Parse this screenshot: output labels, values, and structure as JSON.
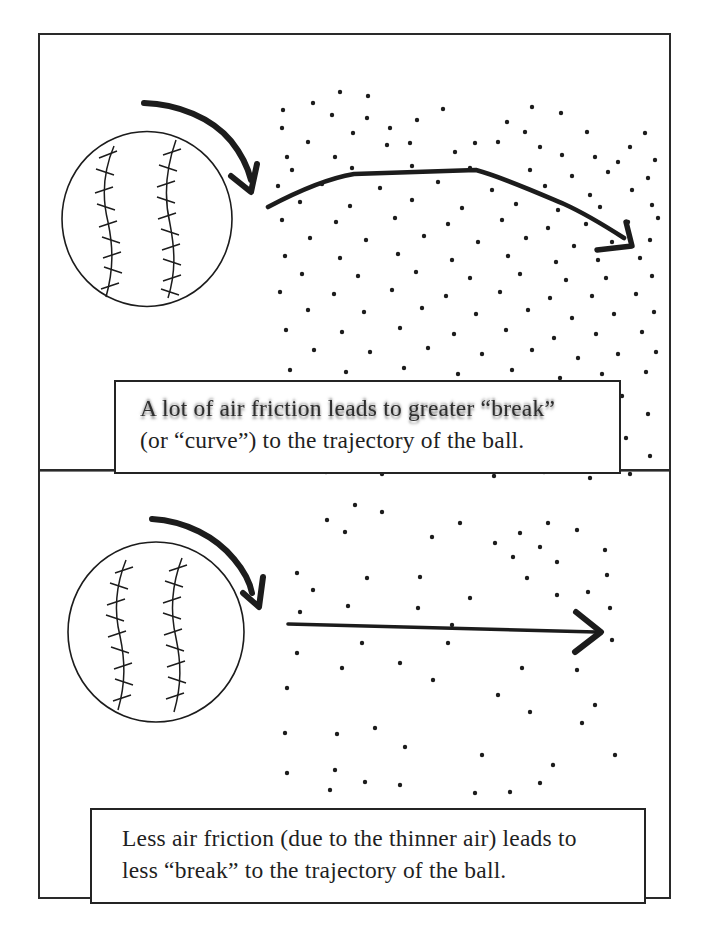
{
  "figure": {
    "type": "physics-diagram",
    "colors": {
      "ink": "#1c1c1c",
      "paper": "#ffffff",
      "frame": "#2a2a2a"
    },
    "panels": [
      {
        "id": "dense-air",
        "ball_icon": "baseball-icon",
        "spin_icon": "clockwise-spin-arrow-icon",
        "trajectory_icon": "breaking-trajectory-arrow-icon",
        "dots_icon": "air-molecule-dots",
        "caption": {
          "lines": [
            "A lot of air friction leads to greater “break”",
            "(or “curve”) to the trajectory of the ball."
          ]
        },
        "air_dots": [
          [
            340,
            92
          ],
          [
            368,
            96
          ],
          [
            283,
            110
          ],
          [
            313,
            103
          ],
          [
            443,
            109
          ],
          [
            532,
            107
          ],
          [
            561,
            113
          ],
          [
            282,
            128
          ],
          [
            332,
            115
          ],
          [
            390,
            128
          ],
          [
            417,
            120
          ],
          [
            507,
            122
          ],
          [
            525,
            132
          ],
          [
            587,
            132
          ],
          [
            645,
            133
          ],
          [
            287,
            157
          ],
          [
            308,
            142
          ],
          [
            353,
            133
          ],
          [
            387,
            145
          ],
          [
            410,
            143
          ],
          [
            455,
            152
          ],
          [
            475,
            143
          ],
          [
            498,
            142
          ],
          [
            540,
            147
          ],
          [
            562,
            155
          ],
          [
            595,
            157
          ],
          [
            618,
            162
          ],
          [
            335,
            157
          ],
          [
            367,
            118
          ],
          [
            630,
            147
          ],
          [
            655,
            160
          ],
          [
            292,
            170
          ],
          [
            352,
            168
          ],
          [
            412,
            166
          ],
          [
            470,
            168
          ],
          [
            530,
            170
          ],
          [
            572,
            176
          ],
          [
            608,
            172
          ],
          [
            648,
            178
          ],
          [
            278,
            186
          ],
          [
            322,
            184
          ],
          [
            380,
            188
          ],
          [
            438,
            182
          ],
          [
            492,
            190
          ],
          [
            545,
            186
          ],
          [
            590,
            195
          ],
          [
            632,
            190
          ],
          [
            300,
            202
          ],
          [
            350,
            206
          ],
          [
            412,
            200
          ],
          [
            462,
            208
          ],
          [
            516,
            204
          ],
          [
            558,
            210
          ],
          [
            600,
            207
          ],
          [
            652,
            205
          ],
          [
            282,
            220
          ],
          [
            336,
            222
          ],
          [
            395,
            218
          ],
          [
            448,
            224
          ],
          [
            502,
            220
          ],
          [
            548,
            228
          ],
          [
            586,
            224
          ],
          [
            628,
            222
          ],
          [
            658,
            218
          ],
          [
            310,
            238
          ],
          [
            366,
            240
          ],
          [
            424,
            236
          ],
          [
            478,
            242
          ],
          [
            526,
            238
          ],
          [
            574,
            246
          ],
          [
            612,
            242
          ],
          [
            650,
            240
          ],
          [
            285,
            256
          ],
          [
            340,
            258
          ],
          [
            398,
            254
          ],
          [
            452,
            260
          ],
          [
            508,
            256
          ],
          [
            556,
            262
          ],
          [
            598,
            260
          ],
          [
            640,
            258
          ],
          [
            302,
            274
          ],
          [
            358,
            276
          ],
          [
            416,
            272
          ],
          [
            470,
            278
          ],
          [
            520,
            274
          ],
          [
            566,
            280
          ],
          [
            606,
            278
          ],
          [
            652,
            276
          ],
          [
            280,
            292
          ],
          [
            334,
            294
          ],
          [
            392,
            290
          ],
          [
            446,
            296
          ],
          [
            500,
            292
          ],
          [
            550,
            298
          ],
          [
            592,
            296
          ],
          [
            636,
            294
          ],
          [
            308,
            310
          ],
          [
            364,
            312
          ],
          [
            422,
            308
          ],
          [
            476,
            314
          ],
          [
            528,
            310
          ],
          [
            572,
            318
          ],
          [
            614,
            314
          ],
          [
            654,
            312
          ],
          [
            286,
            330
          ],
          [
            342,
            332
          ],
          [
            400,
            328
          ],
          [
            454,
            334
          ],
          [
            506,
            330
          ],
          [
            554,
            338
          ],
          [
            596,
            334
          ],
          [
            642,
            332
          ],
          [
            314,
            350
          ],
          [
            370,
            352
          ],
          [
            428,
            348
          ],
          [
            482,
            354
          ],
          [
            532,
            350
          ],
          [
            578,
            358
          ],
          [
            618,
            354
          ],
          [
            656,
            352
          ],
          [
            290,
            370
          ],
          [
            346,
            372
          ],
          [
            404,
            368
          ],
          [
            458,
            374
          ],
          [
            512,
            370
          ],
          [
            560,
            378
          ],
          [
            602,
            374
          ],
          [
            646,
            372
          ],
          [
            318,
            392
          ],
          [
            374,
            394
          ],
          [
            432,
            390
          ],
          [
            486,
            396
          ],
          [
            536,
            392
          ],
          [
            582,
            400
          ],
          [
            622,
            396
          ],
          [
            294,
            412
          ],
          [
            350,
            414
          ],
          [
            408,
            410
          ],
          [
            462,
            416
          ],
          [
            514,
            412
          ],
          [
            564,
            420
          ],
          [
            606,
            416
          ],
          [
            648,
            414
          ],
          [
            322,
            434
          ],
          [
            378,
            436
          ],
          [
            436,
            432
          ],
          [
            490,
            438
          ],
          [
            540,
            434
          ],
          [
            586,
            442
          ],
          [
            626,
            438
          ],
          [
            298,
            454
          ],
          [
            354,
            456
          ],
          [
            412,
            452
          ],
          [
            466,
            458
          ],
          [
            518,
            454
          ],
          [
            568,
            462
          ],
          [
            610,
            458
          ],
          [
            650,
            456
          ],
          [
            326,
            472
          ],
          [
            382,
            474
          ],
          [
            440,
            470
          ],
          [
            494,
            476
          ],
          [
            544,
            472
          ],
          [
            590,
            478
          ],
          [
            630,
            474
          ]
        ]
      },
      {
        "id": "thin-air",
        "ball_icon": "baseball-icon",
        "spin_icon": "clockwise-spin-arrow-icon",
        "trajectory_icon": "straight-trajectory-arrow-icon",
        "dots_icon": "air-molecule-dots",
        "caption": {
          "lines": [
            "Less air friction (due to the thinner air) leads to",
            "less “break” to the trajectory of the ball."
          ]
        },
        "air_dots": [
          [
            355,
            505
          ],
          [
            382,
            512
          ],
          [
            327,
            520
          ],
          [
            345,
            532
          ],
          [
            432,
            537
          ],
          [
            460,
            523
          ],
          [
            495,
            543
          ],
          [
            520,
            533
          ],
          [
            540,
            547
          ],
          [
            548,
            523
          ],
          [
            577,
            530
          ],
          [
            605,
            550
          ],
          [
            513,
            557
          ],
          [
            557,
            562
          ],
          [
            607,
            575
          ],
          [
            297,
            573
          ],
          [
            313,
            590
          ],
          [
            367,
            578
          ],
          [
            420,
            577
          ],
          [
            470,
            598
          ],
          [
            527,
            578
          ],
          [
            557,
            595
          ],
          [
            588,
            592
          ],
          [
            348,
            606
          ],
          [
            418,
            608
          ],
          [
            452,
            625
          ],
          [
            610,
            608
          ],
          [
            300,
            612
          ],
          [
            362,
            643
          ],
          [
            448,
            643
          ],
          [
            297,
            653
          ],
          [
            342,
            668
          ],
          [
            400,
            663
          ],
          [
            522,
            668
          ],
          [
            577,
            670
          ],
          [
            612,
            640
          ],
          [
            287,
            688
          ],
          [
            433,
            680
          ],
          [
            498,
            695
          ],
          [
            530,
            712
          ],
          [
            582,
            723
          ],
          [
            595,
            705
          ],
          [
            285,
            733
          ],
          [
            337,
            734
          ],
          [
            375,
            728
          ],
          [
            405,
            747
          ],
          [
            482,
            755
          ],
          [
            553,
            765
          ],
          [
            615,
            755
          ],
          [
            287,
            773
          ],
          [
            335,
            770
          ],
          [
            365,
            782
          ],
          [
            400,
            785
          ],
          [
            475,
            793
          ],
          [
            510,
            792
          ],
          [
            540,
            783
          ],
          [
            330,
            790
          ]
        ]
      }
    ]
  }
}
